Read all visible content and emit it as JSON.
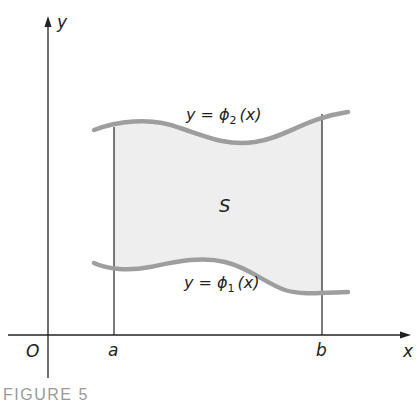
{
  "figure": {
    "caption": "FIGURE 5",
    "region_label": "S",
    "axes": {
      "x_label": "x",
      "y_label": "y",
      "origin_label": "O"
    },
    "bounds": {
      "left_label": "a",
      "right_label": "b"
    },
    "curves": {
      "upper": {
        "label_prefix": "y = ϕ",
        "subscript": "2",
        "label_suffix": "(x)"
      },
      "lower": {
        "label_prefix": "y = ϕ",
        "subscript": "1",
        "label_suffix": "(x)"
      }
    },
    "colors": {
      "axis": "#222222",
      "curve": "#9e9e9e",
      "region_fill": "#eeeeee",
      "caption": "#9a9a9a"
    }
  }
}
